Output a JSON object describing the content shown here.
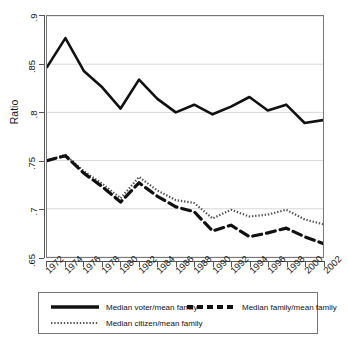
{
  "chart_data": {
    "type": "line",
    "title": "",
    "xlabel": "",
    "ylabel": "Ratio",
    "ylim": [
      0.65,
      0.9
    ],
    "yticks": [
      ".65",
      ".7",
      ".75",
      ".8",
      ".85",
      ".9"
    ],
    "ytick_values": [
      0.65,
      0.7,
      0.75,
      0.8,
      0.85,
      0.9
    ],
    "grid": true,
    "grid_axis": "y",
    "legend_position": "bottom",
    "categories": [
      "1972",
      "1974",
      "1976",
      "1978",
      "1980",
      "1982",
      "1984",
      "1986",
      "1988",
      "1990",
      "1992",
      "1994",
      "1996",
      "1998",
      "2000",
      "2002"
    ],
    "x": [
      1972,
      1974,
      1976,
      1978,
      1980,
      1982,
      1984,
      1986,
      1988,
      1990,
      1992,
      1994,
      1996,
      1998,
      2000,
      2002
    ],
    "series": [
      {
        "name": "Median voter/mean family",
        "style": "solid",
        "color": "#111111",
        "values": [
          0.847,
          0.877,
          0.843,
          0.826,
          0.804,
          0.834,
          0.814,
          0.8,
          0.808,
          0.798,
          0.806,
          0.816,
          0.802,
          0.808,
          0.789,
          0.792
        ]
      },
      {
        "name": "Median family/mean family",
        "style": "dashed",
        "color": "#111111",
        "values": [
          0.75,
          0.755,
          0.737,
          0.723,
          0.707,
          0.727,
          0.713,
          0.702,
          0.697,
          0.677,
          0.683,
          0.671,
          0.675,
          0.68,
          0.671,
          0.664
        ]
      },
      {
        "name": "Median citizen/mean family",
        "style": "dotted",
        "color": "#555555",
        "values": [
          0.75,
          0.756,
          0.739,
          0.726,
          0.711,
          0.733,
          0.719,
          0.709,
          0.706,
          0.69,
          0.699,
          0.692,
          0.694,
          0.699,
          0.689,
          0.684
        ]
      }
    ]
  },
  "legend": {
    "items": [
      {
        "label": "Median voter/mean family",
        "style": "solid"
      },
      {
        "label": "Median family/mean family",
        "style": "dashed"
      },
      {
        "label": "Median citizen/mean family",
        "style": "dotted"
      }
    ]
  }
}
